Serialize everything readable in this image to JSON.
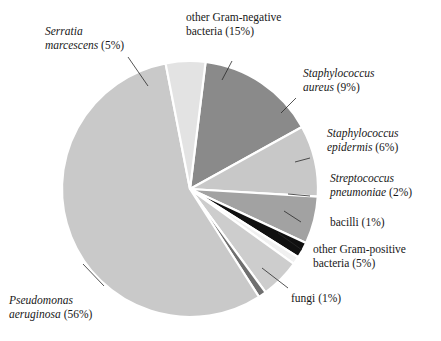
{
  "figure": {
    "kind": "pie-chart",
    "background_color": "#ffffff",
    "slice_separator_color": "#ffffff"
  },
  "chart_data": {
    "type": "pie",
    "title": "",
    "xlabel": "",
    "ylabel": "",
    "units": "percent",
    "total": 100,
    "start_angle_deg": -83,
    "direction": "clockwise",
    "center": {
      "x": 190,
      "y": 189
    },
    "radius": 128,
    "categories": [
      "other Gram-negative bacteria",
      "Staphylococcus aureus",
      "Staphylococcus epidermis",
      "Streptococcus pneumoniae",
      "bacilli",
      "other Gram-positive bacteria",
      "fungi",
      "Pseudomonas aeruginosa",
      "Serratia marcescens"
    ],
    "values": [
      15,
      9,
      6,
      2,
      1,
      5,
      1,
      56,
      5
    ],
    "colors": [
      "#8a8a8a",
      "#c8c8c8",
      "#a2a2a2",
      "#101010",
      "#f0f0f0",
      "#cdcdcd",
      "#6f6f6f",
      "#c9c9c9",
      "#e3e3e3"
    ],
    "slices": [
      {
        "name": "other Gram-negative bacteria",
        "value": 15,
        "label": "other Gram-negative bacteria (15%)",
        "color": "#8a8a8a",
        "italic_part": "",
        "roman_part": "other Gram-negative bacteria (15%)"
      },
      {
        "name": "Staphylococcus aureus",
        "value": 9,
        "label": "Staphylococcus aureus (9%)",
        "color": "#c8c8c8",
        "italic_part": "Staphylococcus aureus",
        "roman_part": "(9%)"
      },
      {
        "name": "Staphylococcus epidermis",
        "value": 6,
        "label": "Staphylococcus epidermis (6%)",
        "color": "#a2a2a2",
        "italic_part": "Staphylococcus epidermis",
        "roman_part": "(6%)"
      },
      {
        "name": "Streptococcus pneumoniae",
        "value": 2,
        "label": "Streptococcus pneumoniae (2%)",
        "color": "#101010",
        "italic_part": "Streptococcus pneumoniae",
        "roman_part": "(2%)"
      },
      {
        "name": "bacilli",
        "value": 1,
        "label": "bacilli (1%)",
        "color": "#f0f0f0",
        "italic_part": "",
        "roman_part": "bacilli (1%)"
      },
      {
        "name": "other Gram-positive bacteria",
        "value": 5,
        "label": "other Gram-positive bacteria (5%)",
        "color": "#cdcdcd",
        "italic_part": "",
        "roman_part": "other Gram-positive bacteria (5%)"
      },
      {
        "name": "fungi",
        "value": 1,
        "label": "fungi (1%)",
        "color": "#6f6f6f",
        "italic_part": "",
        "roman_part": "fungi (1%)"
      },
      {
        "name": "Pseudomonas aeruginosa",
        "value": 56,
        "label": "Pseudomonas aeruginosa (56%)",
        "color": "#c9c9c9",
        "italic_part": "Pseudomonas aeruginosa",
        "roman_part": "(56%)"
      },
      {
        "name": "Serratia marcescens",
        "value": 5,
        "label": "Serratia marcescens (5%)",
        "color": "#e3e3e3",
        "italic_part": "Serratia marcescens",
        "roman_part": "(5%)"
      }
    ],
    "legend": {
      "position": "callout-labels-outside",
      "visible": true
    },
    "grid": false
  },
  "labels": {
    "gram_negative": {
      "line1": "other Gram-negative",
      "line2": "bacteria (15%)"
    },
    "serratia": {
      "line1": "Serratia",
      "line2_italic": "marcescens",
      "line2_roman": " (5%)"
    },
    "staph_aureus": {
      "line1": "Staphylococcus",
      "line2_italic": "aureus",
      "line2_roman": " (9%)"
    },
    "staph_epidermis": {
      "line1": "Staphylococcus",
      "line2_italic": "epidermis",
      "line2_roman": " (6%)"
    },
    "strep_pneumoniae": {
      "line1": "Streptococcus",
      "line2_italic": "pneumoniae",
      "line2_roman": " (2%)"
    },
    "bacilli": {
      "line1": "bacilli (1%)"
    },
    "gram_positive": {
      "line1": "other Gram-positive",
      "line2": "bacteria (5%)"
    },
    "fungi": {
      "line1": "fungi (1%)"
    },
    "pseudomonas": {
      "line1": "Pseudomonas",
      "line2_italic": "aeruginosa",
      "line2_roman": " (56%)"
    }
  }
}
